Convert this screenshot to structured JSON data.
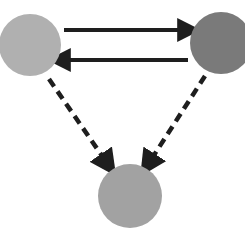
{
  "diagram": {
    "nodes": [
      {
        "id": "left",
        "cx": 30,
        "cy": 45,
        "r": 31,
        "color": "#b0b0b0"
      },
      {
        "id": "right",
        "cx": 221,
        "cy": 43,
        "r": 31,
        "color": "#7a7a7a"
      },
      {
        "id": "bottom",
        "cx": 130,
        "cy": 196,
        "r": 32,
        "color": "#a2a2a2"
      }
    ],
    "edges": [
      {
        "from": "left",
        "to": "right",
        "style": "solid",
        "x1": 64,
        "y1": 30,
        "x2": 190,
        "y2": 30
      },
      {
        "from": "right",
        "to": "left",
        "style": "solid",
        "x1": 188,
        "y1": 60,
        "x2": 58,
        "y2": 60
      },
      {
        "from": "left",
        "to": "bottom",
        "style": "dashed",
        "x1": 49,
        "y1": 79,
        "x2": 109,
        "y2": 166
      },
      {
        "from": "right",
        "to": "bottom",
        "style": "dashed",
        "x1": 205,
        "y1": 76,
        "x2": 147,
        "y2": 166
      }
    ],
    "arrow_color": "#1e1e1e"
  }
}
